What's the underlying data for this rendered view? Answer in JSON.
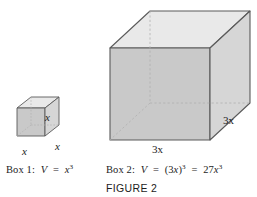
{
  "figure": {
    "label": "FIGURE 2",
    "colors": {
      "top_face": "#e9e9e9",
      "front_face": "#c9c9c9",
      "side_face": "#d6d6d6",
      "outline": "#5a5a5a",
      "hidden_edge": "#b0b0b0",
      "text": "#1c1c1c",
      "background": "#ffffff"
    }
  },
  "box1": {
    "name": "Box 1",
    "edge_label_width": "x",
    "edge_label_depth": "x",
    "edge_label_height": "x",
    "caption_prefix": "Box 1:",
    "caption_volume_symbol": "V",
    "caption_equals": "=",
    "caption_expr_base": "x",
    "caption_expr_exp": "3"
  },
  "box2": {
    "name": "Box 2",
    "edge_label_width": "3x",
    "edge_label_depth": "3x",
    "caption_prefix": "Box 2:",
    "caption_volume_symbol": "V",
    "caption_equals_1": "=",
    "caption_expr1_open": "(3",
    "caption_expr1_var": "x",
    "caption_expr1_close": ")",
    "caption_expr1_exp": "3",
    "caption_equals_2": "=",
    "caption_expr2_coef": "27",
    "caption_expr2_var": "x",
    "caption_expr2_exp": "3"
  }
}
